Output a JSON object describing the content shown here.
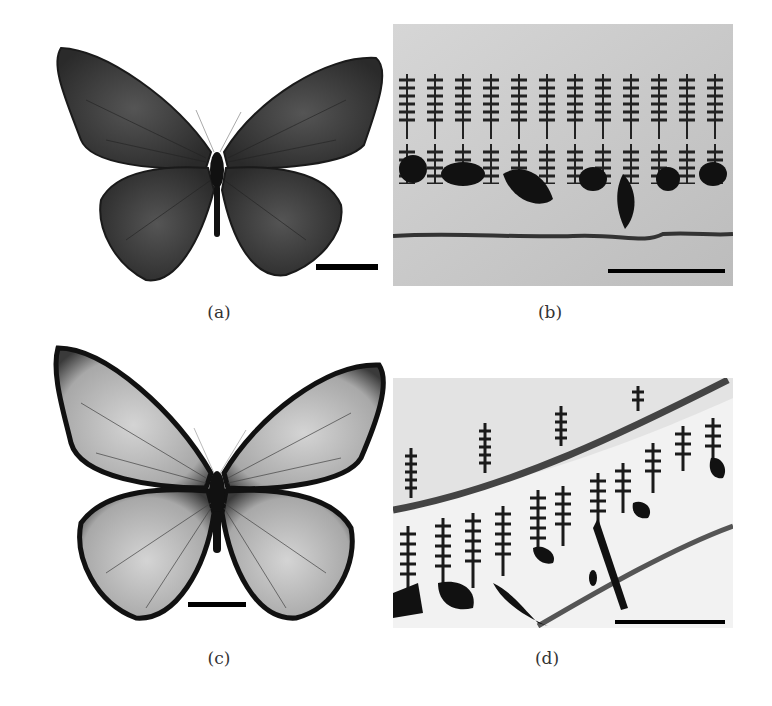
{
  "figure": {
    "panels": [
      {
        "id": "a",
        "label": "(a)",
        "content": "butterfly-dark",
        "has_scale_bar": true
      },
      {
        "id": "b",
        "label": "(b)",
        "content": "scale-micrograph-row",
        "has_scale_bar": true
      },
      {
        "id": "c",
        "label": "(c)",
        "content": "butterfly-light",
        "has_scale_bar": true
      },
      {
        "id": "d",
        "label": "(d)",
        "content": "scale-micrograph-diagonal",
        "has_scale_bar": true
      }
    ]
  },
  "colors": {
    "background": "#ffffff",
    "wing_dark": "#3a3a3a",
    "wing_light": "#b5b5b5",
    "micrograph_bg": "#c8c8c8",
    "ink": "#111111"
  }
}
